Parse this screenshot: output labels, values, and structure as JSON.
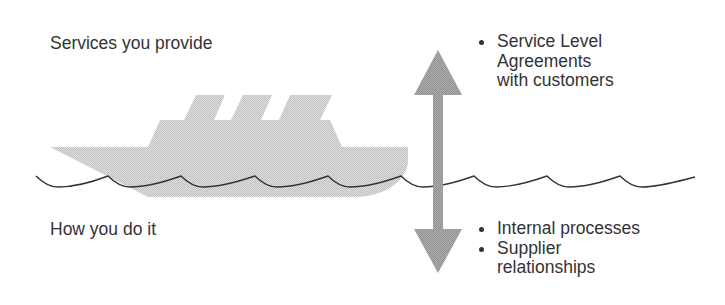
{
  "diagram": {
    "top_label": "Services you provide",
    "bottom_label": "How you do it",
    "top_bullets": [
      {
        "lines": [
          "Service Level",
          "Agreements",
          "with customers"
        ]
      }
    ],
    "bottom_bullets": [
      {
        "lines": [
          "Internal processes"
        ]
      },
      {
        "lines": [
          "Supplier",
          "relationships"
        ]
      }
    ],
    "graphics": {
      "ship_icon": "ship-icon",
      "wave_line": "waterline-wave",
      "arrow": "double-headed-vertical-arrow"
    },
    "colors": {
      "text": "#333333",
      "ship_fill": "#d6d6d6",
      "arrow_fill": "#a3a3a3",
      "wave_stroke": "#333333",
      "background": "#ffffff"
    }
  }
}
